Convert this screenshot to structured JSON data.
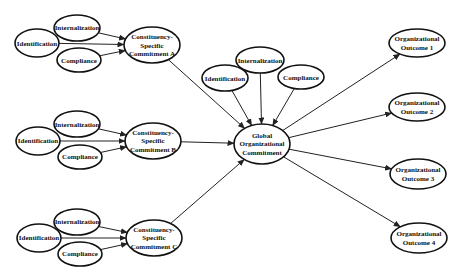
{
  "diagram": {
    "type": "path-model",
    "width": 463,
    "height": 280,
    "colors": {
      "stroke": "#111111",
      "fill": "#ffffff",
      "edge": "#222222"
    },
    "nodes": [
      {
        "id": "intA",
        "lines": [
          "Internalization"
        ],
        "cx": 77,
        "cy": 28,
        "rx": 23,
        "ry": 13,
        "fs": 7
      },
      {
        "id": "idA",
        "lines": [
          "Identification"
        ],
        "cx": 37,
        "cy": 43,
        "rx": 22,
        "ry": 14,
        "fs": 7
      },
      {
        "id": "compA",
        "lines": [
          "Compliance"
        ],
        "cx": 79,
        "cy": 60,
        "rx": 22,
        "ry": 12,
        "fs": 7
      },
      {
        "id": "csA",
        "lines": [
          "Constituency-",
          "Specific",
          "Commitment A"
        ],
        "cx": 152,
        "cy": 45,
        "rx": 28,
        "ry": 18,
        "fs": 7
      },
      {
        "id": "intB",
        "lines": [
          "Internalization"
        ],
        "cx": 77,
        "cy": 124,
        "rx": 23,
        "ry": 13,
        "fs": 7
      },
      {
        "id": "idB",
        "lines": [
          "Identification"
        ],
        "cx": 38,
        "cy": 141,
        "rx": 22,
        "ry": 14,
        "fs": 7
      },
      {
        "id": "compB",
        "lines": [
          "Compliance"
        ],
        "cx": 80,
        "cy": 157,
        "rx": 22,
        "ry": 12,
        "fs": 7
      },
      {
        "id": "csB",
        "lines": [
          "Constituency-",
          "Specific",
          "Commitment B"
        ],
        "cx": 153,
        "cy": 141,
        "rx": 28,
        "ry": 18,
        "fs": 7
      },
      {
        "id": "intC",
        "lines": [
          "Internalization"
        ],
        "cx": 77,
        "cy": 222,
        "rx": 23,
        "ry": 13,
        "fs": 7
      },
      {
        "id": "idC",
        "lines": [
          "Identification"
        ],
        "cx": 39,
        "cy": 238,
        "rx": 22,
        "ry": 14,
        "fs": 7
      },
      {
        "id": "compC",
        "lines": [
          "Compliance"
        ],
        "cx": 80,
        "cy": 254,
        "rx": 22,
        "ry": 12,
        "fs": 7
      },
      {
        "id": "csC",
        "lines": [
          "Constituency-",
          "Specific",
          "Commitment C"
        ],
        "cx": 154,
        "cy": 238,
        "rx": 28,
        "ry": 18,
        "fs": 7
      },
      {
        "id": "intG",
        "lines": [
          "Internalization"
        ],
        "cx": 260,
        "cy": 60,
        "rx": 24,
        "ry": 13,
        "fs": 7
      },
      {
        "id": "idG",
        "lines": [
          "Identification"
        ],
        "cx": 225,
        "cy": 78,
        "rx": 23,
        "ry": 13,
        "fs": 7
      },
      {
        "id": "compG",
        "lines": [
          "Compliance"
        ],
        "cx": 301,
        "cy": 77,
        "rx": 23,
        "ry": 12,
        "fs": 7
      },
      {
        "id": "global",
        "lines": [
          "Global",
          "Organizational",
          "Commitment"
        ],
        "cx": 262,
        "cy": 144,
        "rx": 28,
        "ry": 20,
        "fs": 7
      },
      {
        "id": "out1",
        "lines": [
          "Organizational",
          "Outcome 1"
        ],
        "cx": 417,
        "cy": 43,
        "rx": 28,
        "ry": 14,
        "fs": 7
      },
      {
        "id": "out2",
        "lines": [
          "Organizational",
          "Outcome 2"
        ],
        "cx": 417,
        "cy": 107,
        "rx": 28,
        "ry": 14,
        "fs": 7
      },
      {
        "id": "out3",
        "lines": [
          "Organizational",
          "Outcome 3"
        ],
        "cx": 418,
        "cy": 174,
        "rx": 28,
        "ry": 15,
        "fs": 7
      },
      {
        "id": "out4",
        "lines": [
          "Organizational",
          "Outcome 4"
        ],
        "cx": 419,
        "cy": 238,
        "rx": 28,
        "ry": 15,
        "fs": 7
      }
    ],
    "edges": [
      {
        "from": "intA",
        "to": "csA"
      },
      {
        "from": "idA",
        "to": "csA"
      },
      {
        "from": "compA",
        "to": "csA"
      },
      {
        "from": "intB",
        "to": "csB"
      },
      {
        "from": "idB",
        "to": "csB"
      },
      {
        "from": "compB",
        "to": "csB"
      },
      {
        "from": "intC",
        "to": "csC"
      },
      {
        "from": "idC",
        "to": "csC"
      },
      {
        "from": "compC",
        "to": "csC"
      },
      {
        "from": "csA",
        "to": "global"
      },
      {
        "from": "csB",
        "to": "global"
      },
      {
        "from": "csC",
        "to": "global"
      },
      {
        "from": "idG",
        "to": "global"
      },
      {
        "from": "intG",
        "to": "global"
      },
      {
        "from": "compG",
        "to": "global"
      },
      {
        "from": "global",
        "to": "out1"
      },
      {
        "from": "global",
        "to": "out2"
      },
      {
        "from": "global",
        "to": "out3"
      },
      {
        "from": "global",
        "to": "out4"
      }
    ]
  }
}
